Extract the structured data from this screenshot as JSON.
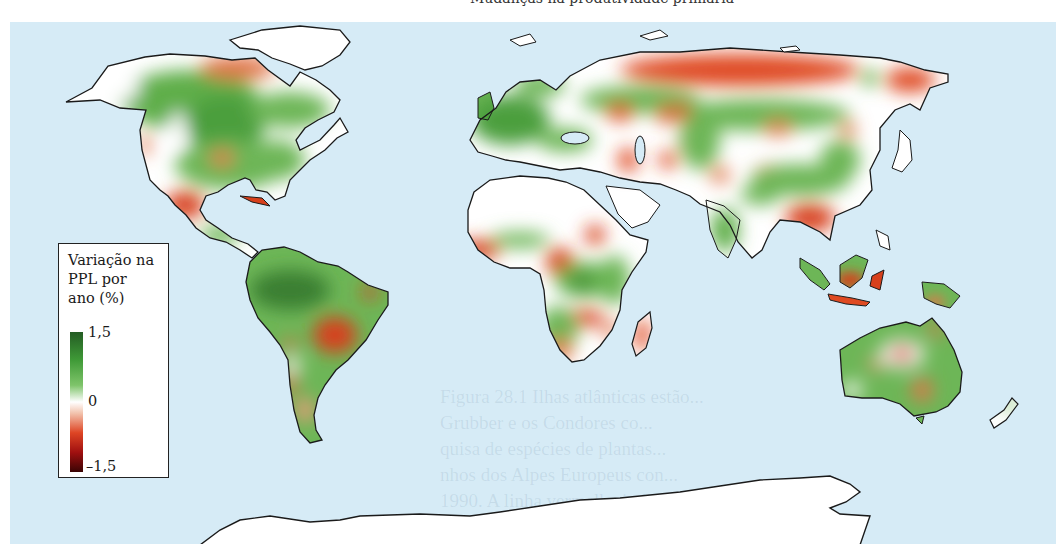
{
  "figure": {
    "top_caption_fragment": "Mudanças na produtividade primária",
    "show_through_text": [
      "Figura 28.1  Ilhas atlânticas estão...",
      "Grubber e os Condores co...",
      "quisa de espécies de plantas...",
      "nhos dos Alpes Europeus con...",
      "1990. A linha vermelha indica o relação entre o...",
      "...nas ... históricas"
    ]
  },
  "legend": {
    "title_line1": "Variação na",
    "title_line2": "PPL por",
    "title_line3": "ano (%)",
    "max_label": "1,5",
    "mid_label": "0",
    "min_label": "–1,5"
  },
  "map": {
    "type": "choropleth",
    "variable": "Variação na PPL por ano (%)",
    "scale": {
      "min": -1.5,
      "mid": 0,
      "max": 1.5
    },
    "colors": {
      "ocean": "#d6ebf6",
      "land_neutral": "#ffffff",
      "strong_positive": "#1f4d1d",
      "positive": "#5fae4a",
      "negative": "#df4a22",
      "strong_negative": "#3a0404",
      "outline": "#1a1a1a"
    },
    "regions": [
      {
        "name": "Amazônia",
        "trend": "strong positive"
      },
      {
        "name": "África Central",
        "trend": "strong positive"
      },
      {
        "name": "Sibéria setentrional",
        "trend": "negative"
      },
      {
        "name": "México",
        "trend": "negative"
      },
      {
        "name": "Brasil central",
        "trend": "negative"
      },
      {
        "name": "Sudeste Asiático",
        "trend": "negative"
      },
      {
        "name": "Europa",
        "trend": "positive"
      },
      {
        "name": "América do Norte",
        "trend": "positive"
      },
      {
        "name": "Saara",
        "trend": "neutral"
      },
      {
        "name": "Antártida",
        "trend": "no data"
      },
      {
        "name": "Groenlândia",
        "trend": "no data"
      }
    ]
  }
}
